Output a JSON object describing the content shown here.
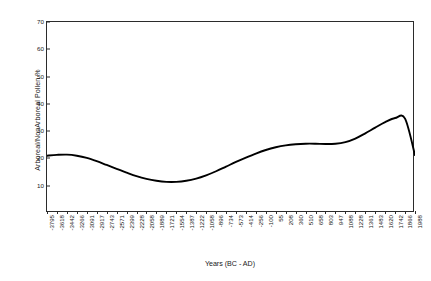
{
  "chart_data": {
    "type": "line",
    "title": "",
    "xlabel": "Years (BC - AD)",
    "ylabel": "Arboreal/NonArboreal Pollen %",
    "ylim": [
      0,
      70
    ],
    "yticks": [
      10,
      20,
      30,
      40,
      50,
      60,
      70
    ],
    "grid": false,
    "legend": null,
    "line_color": "#000000",
    "frame_color": "#2b2b2b",
    "categories": [
      "-3795",
      "-3618",
      "-3442",
      "-3266",
      "-3091",
      "-2917",
      "-2743",
      "-2571",
      "-2399",
      "-2228",
      "-2058",
      "-1889",
      "-1721",
      "-1554",
      "-1387",
      "-1222",
      "-1058",
      "-896",
      "-734",
      "-573",
      "-414",
      "-256",
      "-100",
      "55",
      "208",
      "360",
      "510",
      "658",
      "803",
      "947",
      "1088",
      "1228",
      "1361",
      "1483",
      "1620",
      "1742",
      "1866",
      "1988"
    ],
    "values": [
      21.0,
      21.3,
      21.4,
      21.0,
      20.2,
      19.0,
      17.6,
      16.2,
      14.8,
      13.5,
      12.5,
      11.8,
      11.4,
      11.4,
      11.8,
      12.6,
      13.8,
      15.3,
      17.0,
      18.7,
      20.3,
      21.8,
      23.1,
      24.1,
      24.8,
      25.2,
      25.4,
      25.4,
      25.3,
      25.4,
      26.0,
      27.3,
      29.2,
      31.3,
      33.3,
      34.8,
      34.6,
      21.2
    ]
  }
}
